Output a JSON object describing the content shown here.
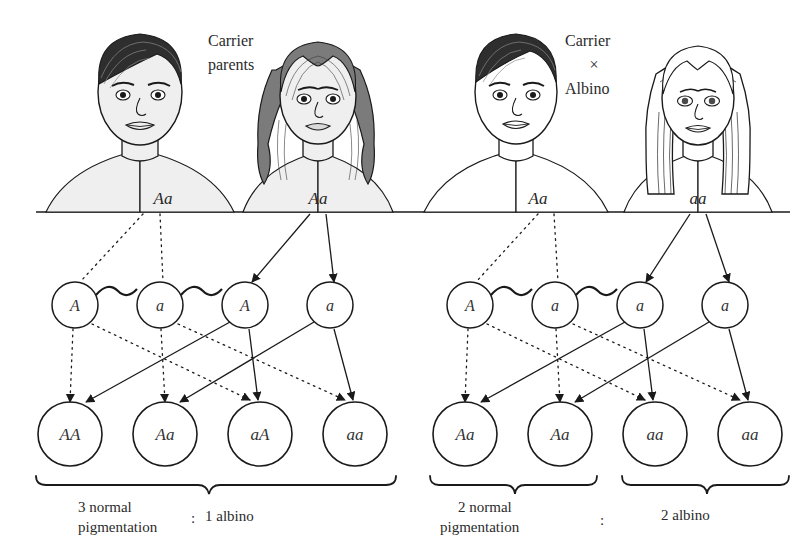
{
  "figure": {
    "type": "genetics-pedigree-diagram",
    "topic": "Albinism inheritance — monohybrid crosses"
  },
  "crosses": [
    {
      "id": "left-cross",
      "caption": "Carrier\nparents",
      "caption_lines": [
        "Carrier",
        "parents"
      ],
      "parents": [
        {
          "sex": "male",
          "genotype": "Aa",
          "phenotype": "normal pigmentation",
          "hair": "dark-short",
          "x": 140
        },
        {
          "sex": "female",
          "genotype": "Aa",
          "phenotype": "normal pigmentation",
          "hair": "dark-long-wavy",
          "x": 318
        }
      ],
      "gametes": [
        {
          "label": "A",
          "source": "male",
          "type": "sperm",
          "x": 75
        },
        {
          "label": "a",
          "source": "male",
          "type": "sperm",
          "x": 160
        },
        {
          "label": "A",
          "source": "female",
          "type": "egg",
          "x": 245
        },
        {
          "label": "a",
          "source": "female",
          "type": "egg",
          "x": 330
        }
      ],
      "offspring": [
        {
          "genotype": "AA",
          "phenotype": "normal",
          "x": 70
        },
        {
          "genotype": "Aa",
          "phenotype": "normal",
          "x": 165
        },
        {
          "genotype": "aA",
          "phenotype": "normal",
          "x": 260
        },
        {
          "genotype": "aa",
          "phenotype": "albino",
          "x": 355
        }
      ],
      "ratio": {
        "left_label_lines": [
          "3 normal",
          "pigmentation"
        ],
        "separator": ":",
        "right_label": "1 albino",
        "normal_count": 3,
        "albino_count": 1,
        "brackets": [
          {
            "label_lines": [
              "3 normal",
              "pigmentation"
            ],
            "x1": 35,
            "x2": 400
          }
        ]
      }
    },
    {
      "id": "right-cross",
      "caption_lines": [
        "Carrier",
        "×",
        "Albino"
      ],
      "parents": [
        {
          "sex": "male",
          "genotype": "Aa",
          "phenotype": "normal pigmentation",
          "hair": "dark-short",
          "x": 516
        },
        {
          "sex": "female",
          "genotype": "aa",
          "phenotype": "albino",
          "hair": "white-long-straight",
          "x": 698
        }
      ],
      "gametes": [
        {
          "label": "A",
          "source": "male",
          "type": "sperm",
          "x": 470
        },
        {
          "label": "a",
          "source": "male",
          "type": "sperm",
          "x": 555
        },
        {
          "label": "a",
          "source": "female",
          "type": "egg",
          "x": 640
        },
        {
          "label": "a",
          "source": "female",
          "type": "egg",
          "x": 725
        }
      ],
      "offspring": [
        {
          "genotype": "Aa",
          "phenotype": "normal",
          "x": 465
        },
        {
          "genotype": "Aa",
          "phenotype": "normal",
          "x": 560
        },
        {
          "genotype": "aa",
          "phenotype": "albino",
          "x": 655
        },
        {
          "genotype": "aa",
          "phenotype": "albino",
          "x": 750
        }
      ],
      "ratio": {
        "left_label_lines": [
          "2 normal",
          "pigmentation"
        ],
        "separator": ":",
        "right_label": "2 albino",
        "normal_count": 2,
        "albino_count": 2,
        "brackets": [
          {
            "label_lines": [
              "2 normal",
              "pigmentation"
            ],
            "x1": 430,
            "x2": 595
          },
          {
            "label_lines": [
              "2 albino"
            ],
            "x1": 625,
            "x2": 790
          }
        ]
      }
    }
  ],
  "labels": {
    "carrier": "Carrier",
    "parents": "parents",
    "times": "×",
    "albino": "Albino",
    "three_normal": "3 normal",
    "pigmentation": "pigmentation",
    "one_albino": "1 albino",
    "two_normal": "2 normal",
    "two_albino": "2 albino",
    "colon": ":",
    "g_A": "A",
    "g_a": "a",
    "geno_Aa": "Aa",
    "geno_aa": "aa",
    "geno_AA": "AA",
    "geno_aA": "aA"
  },
  "colors": {
    "ink": "#1a1a1a",
    "skin_shade": "#efefef",
    "hair_dark": "#6e6e6e",
    "hair_darkest": "#2e2e2e",
    "background": "#ffffff"
  }
}
